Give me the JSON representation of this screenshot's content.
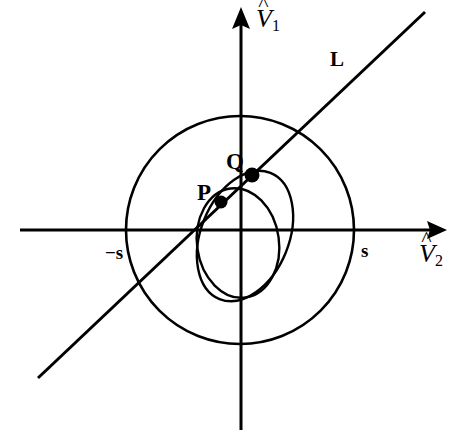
{
  "figure": {
    "type": "geometry-diagram",
    "background": "#ffffff",
    "stroke_color": "#000000",
    "width": 470,
    "height": 444,
    "axes": {
      "vertical": {
        "name": "V1-axis",
        "symbol": "V",
        "hat": "^",
        "subscript": "1",
        "label_x": 258,
        "label_y": 8
      },
      "horizontal": {
        "name": "V2-axis",
        "symbol": "V",
        "hat": "^",
        "subscript": "2",
        "label_x": 420,
        "label_y": 243
      },
      "origin": [
        240,
        230
      ],
      "x_range_px": [
        20,
        447
      ],
      "y_range_px": [
        8,
        430
      ]
    },
    "circle": {
      "name": "outer-circle",
      "cx": 240,
      "cy": 230,
      "r": 114,
      "ticks": [
        {
          "label": "−s",
          "x": 106,
          "y": 246
        },
        {
          "label": "s",
          "x": 362,
          "y": 241
        }
      ]
    },
    "ellipses": [
      {
        "name": "outer-ellipse",
        "cx": 245,
        "cy": 236,
        "rx": 44,
        "ry": 68,
        "rotate": 22
      },
      {
        "name": "inner-ellipse",
        "cx": 238,
        "cy": 243,
        "rx": 41,
        "ry": 55,
        "rotate": -8
      }
    ],
    "line": {
      "name": "line-L",
      "label": "L",
      "label_x": 330,
      "label_y": 50,
      "x1": 38,
      "y1": 378,
      "x2": 425,
      "y2": 12
    },
    "points": [
      {
        "name": "point-P",
        "label": "P",
        "cx": 221,
        "cy": 202,
        "r": 6,
        "label_x": 197,
        "label_y": 181
      },
      {
        "name": "point-Q",
        "label": "Q",
        "cx": 252,
        "cy": 175,
        "r": 7,
        "label_x": 226,
        "label_y": 151
      }
    ]
  }
}
